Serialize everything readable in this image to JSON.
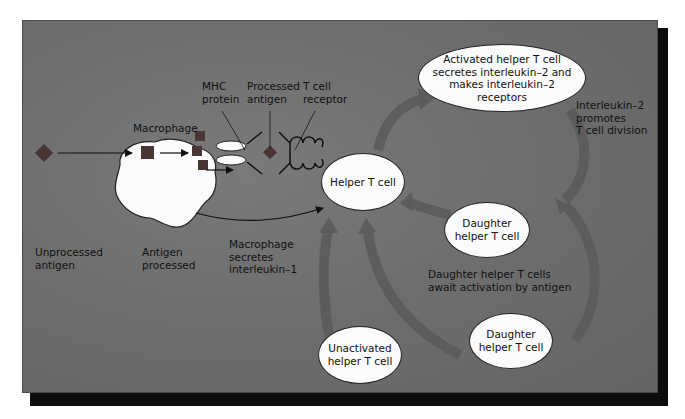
{
  "colors": {
    "background": "#6e6e6e",
    "shadow": "#0d0d0d",
    "cell_fill": "#fbfbfb",
    "antigen": "#4a3535",
    "cycle_arrow": "#5a5a5a",
    "text": "#111111"
  },
  "labels": {
    "macrophage": "Macrophage",
    "mhc_protein": "MHC\nprotein",
    "processed_antigen": "Processed\nantigen",
    "t_cell_receptor": "T cell\nreceptor",
    "unprocessed_antigen": "Unprocessed\nantigen",
    "antigen_processed": "Antigen\nprocessed",
    "macrophage_secretes": "Macrophage\nsecretes\ninterleukin–1",
    "interleukin2_promotes": "Interleukin–2\npromotes\nT cell division",
    "daughters_await": "Daughter helper T cells\nawait activation by antigen"
  },
  "cells": {
    "helper": "Helper T cell",
    "activated": "Activated helper T cell\nsecretes interleukin–2 and\nmakes interleukin–2\nreceptors",
    "daughter_upper": "Daughter\nhelper T cell",
    "daughter_lower": "Daughter\nhelper T cell",
    "unactivated": "Unactivated\nhelper T cell"
  },
  "icons": {
    "antigen": "diamond",
    "processed_fragment": "square",
    "mhc": "ellipse-pair",
    "receptor": "coil"
  }
}
